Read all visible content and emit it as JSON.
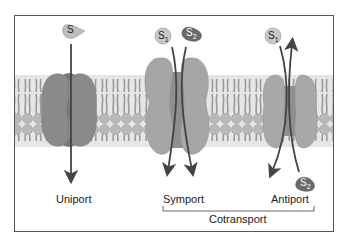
{
  "diagram": {
    "type": "membrane transport mechanisms",
    "transporters": [
      {
        "name": "Uniport",
        "substrates": [
          "S"
        ],
        "direction": "S moves inward (top to bottom)"
      },
      {
        "name": "Symport",
        "substrates": [
          "S1",
          "S2"
        ],
        "direction": "S1 and S2 both move top to bottom"
      },
      {
        "name": "Antiport",
        "substrates": [
          "S1",
          "S2"
        ],
        "direction": "S1 moves top to bottom, S2 moves bottom to top"
      }
    ],
    "grouping": {
      "label": "Cotransport",
      "members": [
        "Symport",
        "Antiport"
      ]
    }
  },
  "labels": {
    "uniport": "Uniport",
    "symport": "Symport",
    "antiport": "Antiport",
    "cotransport": "Cotransport"
  },
  "substrates": {
    "uniport_s": "S",
    "symport_s1": "S",
    "symport_s1_sub": "1",
    "symport_s2": "S",
    "symport_s2_sub": "2",
    "antiport_s1": "S",
    "antiport_s1_sub": "1",
    "antiport_s2": "S",
    "antiport_s2_sub": "2"
  },
  "colors": {
    "frame": "#555555",
    "lipid_head": "#b8b8b8",
    "lipid_tail": "#9a9a9a",
    "uniport_protein": "#8a8a8a",
    "uniport_channel": "#6e6e6e",
    "symport_protein": "#a6a6a6",
    "antiport_protein": "#a8a8a8",
    "arrow": "#444444",
    "s1_light": "#c8c8c8",
    "s2_dark": "#6a6a6a"
  }
}
